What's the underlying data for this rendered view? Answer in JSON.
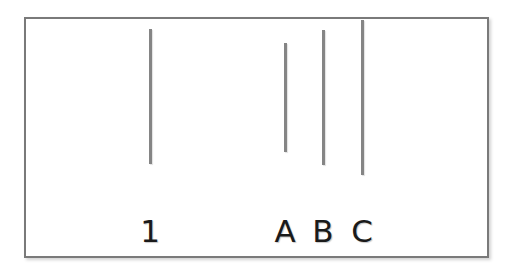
{
  "stimulus": {
    "frame": {
      "border_color": "#7a7a7a",
      "background": "#ffffff"
    },
    "line_color": "#858585",
    "label_color": "#1a1a1a",
    "lines": [
      {
        "id": "reference",
        "label": "1",
        "x": 150,
        "top": 29,
        "bottom": 164
      },
      {
        "id": "A",
        "label": "A",
        "x": 285,
        "top": 43,
        "bottom": 152
      },
      {
        "id": "B",
        "label": "B",
        "x": 323,
        "top": 30,
        "bottom": 165
      },
      {
        "id": "C",
        "label": "C",
        "x": 362,
        "top": 20,
        "bottom": 175
      }
    ],
    "label_top": 216
  }
}
